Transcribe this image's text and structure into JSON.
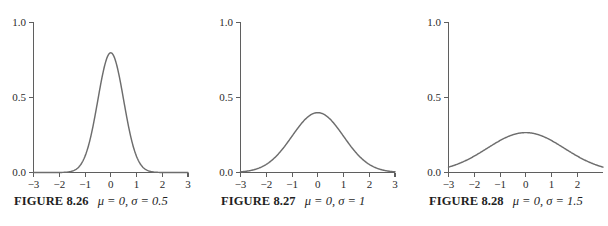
{
  "figure_strip": {
    "background_color": "#ffffff",
    "curve_color": "#6d6d6d",
    "axis_color": "#5f5f5f",
    "text_color": "#1f1f1f"
  },
  "panels": [
    {
      "caption_label": "FIGURE 8.26",
      "caption_params": "μ = 0, σ = 0.5",
      "mu_text": "μ",
      "sigma_text": "σ",
      "mu_value": "0",
      "sigma_value": "0.5"
    },
    {
      "caption_label": "FIGURE 8.27",
      "caption_params": "μ = 0, σ = 1",
      "mu_text": "μ",
      "sigma_text": "σ",
      "mu_value": "0",
      "sigma_value": "1"
    },
    {
      "caption_label": "FIGURE 8.28",
      "caption_params": "μ = 0, σ = 1.5",
      "mu_text": "μ",
      "sigma_text": "σ",
      "mu_value": "0",
      "sigma_value": "1.5"
    }
  ],
  "chart_data": [
    {
      "type": "line",
      "title": "FIGURE 8.26  μ = 0, σ = 0.5",
      "xlabel": "",
      "ylabel": "",
      "xlim": [
        -3,
        3
      ],
      "ylim": [
        0,
        1
      ],
      "xticks": [
        -3,
        -2,
        -1,
        0,
        1,
        2,
        3
      ],
      "xticklabels": [
        "−3",
        "−2",
        "−1",
        "0",
        "1",
        "2",
        "3"
      ],
      "yticks": [
        0.0,
        0.5,
        1.0
      ],
      "yticklabels": [
        "0.0",
        "0.5",
        "1.0"
      ],
      "grid": false,
      "legend": "none",
      "distribution": "normal-pdf",
      "mu": 0,
      "sigma": 0.5,
      "peak_value": 0.798,
      "x": [
        -3,
        -2.5,
        -2,
        -1.75,
        -1.5,
        -1.25,
        -1,
        -0.75,
        -0.5,
        -0.25,
        0,
        0.25,
        0.5,
        0.75,
        1,
        1.25,
        1.5,
        1.75,
        2,
        2.5,
        3
      ],
      "y": [
        0.0,
        0.0,
        0.0003,
        0.0022,
        0.0089,
        0.0308,
        0.108,
        0.2218,
        0.4839,
        0.7041,
        0.7979,
        0.7041,
        0.4839,
        0.2218,
        0.108,
        0.0308,
        0.0089,
        0.0022,
        0.0003,
        0.0,
        0.0
      ]
    },
    {
      "type": "line",
      "title": "FIGURE 8.27  μ = 0, σ = 1",
      "xlabel": "",
      "ylabel": "",
      "xlim": [
        -3,
        3
      ],
      "ylim": [
        0,
        1
      ],
      "xticks": [
        -3,
        -2,
        -1,
        0,
        1,
        2,
        3
      ],
      "xticklabels": [
        "−3",
        "−2",
        "−1",
        "0",
        "1",
        "2",
        "3"
      ],
      "yticks": [
        0.0,
        0.5,
        1.0
      ],
      "yticklabels": [
        "0.0",
        "0.5",
        "1.0"
      ],
      "grid": false,
      "legend": "none",
      "distribution": "normal-pdf",
      "mu": 0,
      "sigma": 1,
      "peak_value": 0.399,
      "x": [
        -3,
        -2.5,
        -2,
        -1.5,
        -1,
        -0.5,
        0,
        0.5,
        1,
        1.5,
        2,
        2.5,
        3
      ],
      "y": [
        0.0044,
        0.0175,
        0.054,
        0.1295,
        0.242,
        0.3521,
        0.3989,
        0.3521,
        0.242,
        0.1295,
        0.054,
        0.0175,
        0.0044
      ]
    },
    {
      "type": "line",
      "title": "FIGURE 8.28  μ = 0, σ = 1.5",
      "xlabel": "",
      "ylabel": "",
      "xlim": [
        -3,
        3
      ],
      "ylim": [
        0,
        1
      ],
      "xticks": [
        -3,
        -2,
        -1,
        0,
        1,
        2
      ],
      "xticklabels": [
        "−3",
        "−2",
        "−1",
        "0",
        "1",
        "2"
      ],
      "yticks": [
        0.0,
        0.5,
        1.0
      ],
      "yticklabels": [
        "0.0",
        "0.5",
        "1.0"
      ],
      "grid": false,
      "legend": "none",
      "note": "right edge of axis cropped by image boundary",
      "distribution": "normal-pdf",
      "mu": 0,
      "sigma": 1.5,
      "peak_value": 0.266,
      "x": [
        -3,
        -2.5,
        -2,
        -1.5,
        -1,
        -0.5,
        0,
        0.5,
        1,
        1.5,
        2,
        2.5,
        3
      ],
      "y": [
        0.036,
        0.0655,
        0.1093,
        0.164,
        0.213,
        0.2515,
        0.266,
        0.2515,
        0.213,
        0.164,
        0.1093,
        0.0655,
        0.036
      ]
    }
  ]
}
